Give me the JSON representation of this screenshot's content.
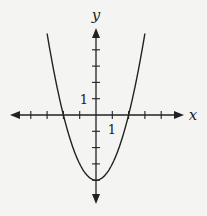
{
  "chart_data": {
    "type": "line",
    "title": "",
    "function": "y = x^2 - 4",
    "xlabel": "x",
    "ylabel": "y",
    "xlim": [
      -5,
      5
    ],
    "ylim": [
      -5,
      5
    ],
    "tick_step": 1,
    "tick_labels": {
      "x": "1",
      "y": "1"
    },
    "grid": false,
    "series": [
      {
        "name": "parabola",
        "x": [
          -3,
          -2.5,
          -2,
          -1.5,
          -1,
          -0.5,
          0,
          0.5,
          1,
          1.5,
          2,
          2.5,
          3
        ],
        "values": [
          5,
          2.25,
          0,
          -1.75,
          -3,
          -3.75,
          -4,
          -3.75,
          -3,
          -1.75,
          0,
          2.25,
          5
        ]
      }
    ],
    "key_points": {
      "vertex": [
        0,
        -4
      ],
      "x_intercepts": [
        -2,
        2
      ],
      "y_intercept": -4
    }
  },
  "axes": {
    "x_label": "x",
    "y_label": "y",
    "x_unit_label": "1",
    "y_unit_label": "1"
  },
  "colors": {
    "background": "#f4f4f2",
    "ink": "#222222"
  }
}
